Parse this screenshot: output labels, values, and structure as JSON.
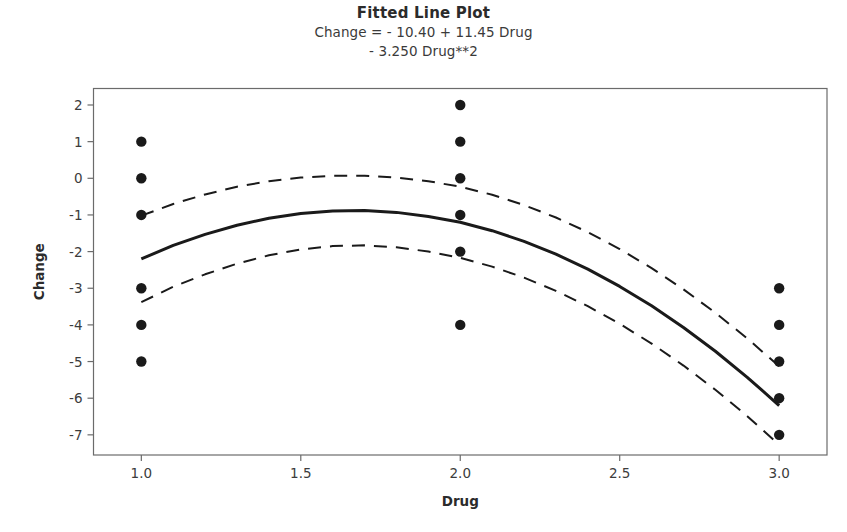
{
  "chart_data": {
    "type": "scatter",
    "title": "Fitted Line Plot",
    "subtitle_line1": "Change =  - 10.40 + 11.45 Drug",
    "subtitle_line2": "- 3.250 Drug**2",
    "xlabel": "Drug",
    "ylabel": "Change",
    "xlim": [
      0.85,
      3.15
    ],
    "ylim": [
      -7.55,
      2.45
    ],
    "xticks": [
      1.0,
      1.5,
      2.0,
      2.5,
      3.0
    ],
    "xticklabels": [
      "1.0",
      "1.5",
      "2.0",
      "2.5",
      "3.0"
    ],
    "yticks": [
      2,
      1,
      0,
      -1,
      -2,
      -3,
      -4,
      -5,
      -6,
      -7
    ],
    "yticklabels": [
      "2",
      "1",
      "0",
      "-1",
      "-2",
      "-3",
      "-4",
      "-5",
      "-6",
      "-7"
    ],
    "grid": false,
    "legend": "none",
    "frame": true,
    "equation": {
      "intercept": -10.4,
      "linear": 11.45,
      "quadratic": -3.25
    },
    "series": [
      {
        "name": "Observed data",
        "type": "scatter",
        "marker": "filled-circle",
        "color": "#1a1a1a",
        "points": [
          {
            "x": 1.0,
            "y": 1
          },
          {
            "x": 1.0,
            "y": 0
          },
          {
            "x": 1.0,
            "y": -1
          },
          {
            "x": 1.0,
            "y": -3
          },
          {
            "x": 1.0,
            "y": -4
          },
          {
            "x": 1.0,
            "y": -5
          },
          {
            "x": 2.0,
            "y": 2
          },
          {
            "x": 2.0,
            "y": 1
          },
          {
            "x": 2.0,
            "y": 0
          },
          {
            "x": 2.0,
            "y": -1
          },
          {
            "x": 2.0,
            "y": -2
          },
          {
            "x": 2.0,
            "y": -4
          },
          {
            "x": 3.0,
            "y": -3
          },
          {
            "x": 3.0,
            "y": -4
          },
          {
            "x": 3.0,
            "y": -5
          },
          {
            "x": 3.0,
            "y": -6
          },
          {
            "x": 3.0,
            "y": -7
          }
        ]
      },
      {
        "name": "Fitted line",
        "type": "line",
        "style": "solid",
        "color": "#1a1a1a",
        "width": 3,
        "x": [
          1.0,
          1.1,
          1.2,
          1.3,
          1.4,
          1.5,
          1.6,
          1.7,
          1.8,
          1.9,
          2.0,
          2.1,
          2.2,
          2.3,
          2.4,
          2.5,
          2.6,
          2.7,
          2.8,
          2.9,
          3.0
        ],
        "y": [
          -2.2,
          -1.83,
          -1.53,
          -1.28,
          -1.09,
          -0.96,
          -0.89,
          -0.88,
          -0.93,
          -1.04,
          -1.2,
          -1.43,
          -1.72,
          -2.07,
          -2.48,
          -2.95,
          -3.48,
          -4.07,
          -4.72,
          -5.43,
          -6.2
        ]
      },
      {
        "name": "Upper confidence band",
        "type": "line",
        "style": "dashed",
        "color": "#1a1a1a",
        "width": 2,
        "x": [
          1.0,
          1.1,
          1.2,
          1.3,
          1.4,
          1.5,
          1.6,
          1.7,
          1.8,
          1.9,
          2.0,
          2.1,
          2.2,
          2.3,
          2.4,
          2.5,
          2.6,
          2.7,
          2.8,
          2.9,
          3.0
        ],
        "y": [
          -1.02,
          -0.7,
          -0.44,
          -0.23,
          -0.08,
          0.02,
          0.07,
          0.07,
          0.02,
          -0.08,
          -0.23,
          -0.45,
          -0.73,
          -1.07,
          -1.47,
          -1.93,
          -2.45,
          -3.03,
          -3.67,
          -4.37,
          -5.13
        ]
      },
      {
        "name": "Lower confidence band",
        "type": "line",
        "style": "dashed",
        "color": "#1a1a1a",
        "width": 2,
        "x": [
          1.0,
          1.1,
          1.2,
          1.3,
          1.4,
          1.5,
          1.6,
          1.7,
          1.8,
          1.9,
          2.0,
          2.1,
          2.2,
          2.3,
          2.4,
          2.5,
          2.6,
          2.7,
          2.8,
          2.9,
          3.0
        ],
        "y": [
          -3.38,
          -2.96,
          -2.62,
          -2.33,
          -2.1,
          -1.94,
          -1.85,
          -1.83,
          -1.88,
          -2.0,
          -2.17,
          -2.41,
          -2.71,
          -3.07,
          -3.49,
          -3.97,
          -4.51,
          -5.11,
          -5.77,
          -6.49,
          -7.27
        ]
      }
    ]
  },
  "colors": {
    "ink": "#1a1a1a",
    "frame": "#6b6b6b",
    "text": "#3c3c3c",
    "background": "#ffffff"
  }
}
